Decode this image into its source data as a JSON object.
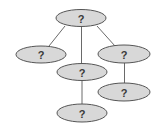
{
  "diagram": {
    "type": "tree",
    "colors": {
      "node_fill": "#d8d8d8",
      "node_stroke": "#555555",
      "edge": "#6a6a6a",
      "label": "#3a3a3a",
      "background": "#ffffff"
    },
    "nodes": [
      {
        "id": "root",
        "label": "?",
        "cx": 81,
        "cy": 18,
        "rx": 25,
        "ry": 8.5
      },
      {
        "id": "left",
        "label": "?",
        "cx": 41,
        "cy": 54,
        "rx": 25,
        "ry": 8.5
      },
      {
        "id": "middle",
        "label": "?",
        "cx": 82,
        "cy": 72,
        "rx": 25,
        "ry": 8.5
      },
      {
        "id": "right",
        "label": "?",
        "cx": 124,
        "cy": 54,
        "rx": 26,
        "ry": 9
      },
      {
        "id": "right-child",
        "label": "?",
        "cx": 124,
        "cy": 92,
        "rx": 26,
        "ry": 9
      },
      {
        "id": "bottom",
        "label": "?",
        "cx": 82,
        "cy": 113,
        "rx": 25,
        "ry": 9
      }
    ],
    "edges": [
      {
        "from": "root",
        "to": "left"
      },
      {
        "from": "root",
        "to": "middle"
      },
      {
        "from": "root",
        "to": "right"
      },
      {
        "from": "middle",
        "to": "bottom"
      },
      {
        "from": "right",
        "to": "right-child"
      }
    ]
  }
}
